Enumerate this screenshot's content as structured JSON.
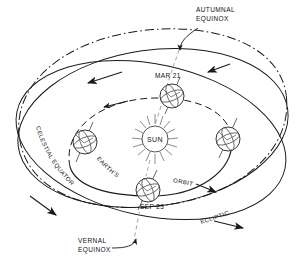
{
  "diagram": {
    "colors": {
      "ink": "#111111",
      "line": "#1a1a1a",
      "faint": "#8c8c8c",
      "background": "#ffffff"
    },
    "labels": {
      "autumnal_equinox_line1": "AUTUMNAL",
      "autumnal_equinox_line2": "EQUINOX",
      "vernal_equinox_line1": "VERNAL",
      "vernal_equinox_line2": "EQUINOX",
      "mar21": "MAR 21",
      "sep23": "SEP 23",
      "sun": "SUN",
      "earths": "EARTH'S",
      "orbit": "ORBIT",
      "celestial_equator": "CELESTIAL  EQUATOR",
      "ecliptic": "ECLIPTIC"
    },
    "icons": {
      "sun": "sun-icon",
      "earth_mar21": "earth-globe-icon",
      "earth_sep23": "earth-globe-icon",
      "earth_left": "earth-globe-icon",
      "earth_right": "earth-globe-icon",
      "autumnal_pointer": "curved-arrow-icon",
      "vernal_pointer": "curved-arrow-icon",
      "direction_arrow": "arrowhead-icon"
    },
    "elements": {
      "celestial_equator_style": "dash-dot",
      "ecliptic_style": "solid",
      "earth_orbit_style": "dashed-far-solid-near",
      "equinox_line_style": "fine-dashed"
    }
  }
}
